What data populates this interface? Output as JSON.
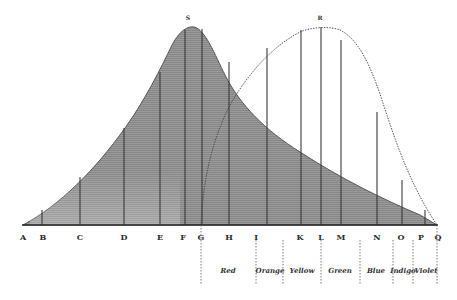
{
  "diagram": {
    "type": "spectrum-curves",
    "curves": [
      {
        "name": "S",
        "style": "solid-shaded",
        "peak_label": "S",
        "description": "heat curve (shaded)"
      },
      {
        "name": "R",
        "style": "dotted",
        "peak_label": "R",
        "description": "light/illumination curve"
      }
    ],
    "peak_labels": {
      "S": "S",
      "R": "R"
    },
    "baseline_labels": [
      "A",
      "B",
      "C",
      "D",
      "E",
      "F",
      "G",
      "H",
      "I",
      "K",
      "L",
      "M",
      "N",
      "O",
      "P",
      "Q"
    ],
    "color_bands": [
      "Red",
      "Orange",
      "Yellow",
      "Green",
      "Blue",
      "Indigo",
      "Violet"
    ],
    "colors": {
      "shade": "#8f8f8f",
      "line": "#444444",
      "background": "#ffffff"
    }
  }
}
